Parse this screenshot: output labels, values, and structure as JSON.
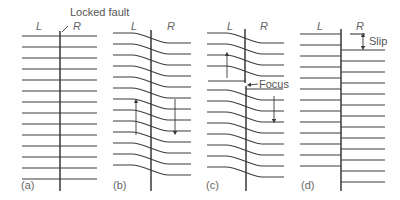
{
  "figure": {
    "annotations": {
      "locked_fault": "Locked fault",
      "focus": "Focus",
      "slip": "Slip"
    },
    "panels": [
      {
        "id": "a",
        "label": "(a)",
        "left": "L",
        "right": "R",
        "state": "undeformed, locked fault"
      },
      {
        "id": "b",
        "label": "(b)",
        "left": "L",
        "right": "R",
        "state": "elastic strain accumulation; L moves up, R moves down"
      },
      {
        "id": "c",
        "label": "(c)",
        "left": "L",
        "right": "R",
        "state": "rupture begins at focus"
      },
      {
        "id": "d",
        "label": "(d)",
        "left": "L",
        "right": "R",
        "state": "elastic rebound; offset equals slip"
      }
    ],
    "colors": {
      "line": "#3a3a3a",
      "text": "#555555",
      "background": "#ffffff"
    }
  }
}
